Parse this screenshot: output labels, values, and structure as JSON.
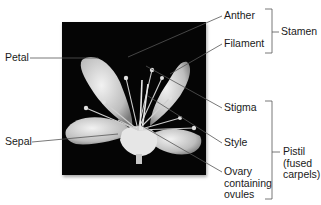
{
  "figure": {
    "labels": {
      "petal": "Petal",
      "sepal": "Sepal",
      "anther": "Anther",
      "filament": "Filament",
      "stigma": "Stigma",
      "style": "Style",
      "ovary_line1": "Ovary",
      "ovary_line2": "containing",
      "ovary_line3": "ovules"
    },
    "groups": {
      "stamen": "Stamen",
      "pistil_line1": "Pistil",
      "pistil_line2": "(fused",
      "pistil_line3": "carpels)"
    },
    "colors": {
      "photo_background": "#050505",
      "leader_line": "#555555",
      "text": "#1a1a1a",
      "flower": "#d8d8d8"
    }
  }
}
